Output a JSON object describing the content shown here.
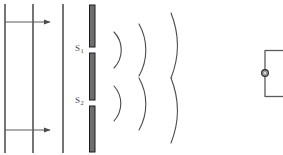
{
  "figure": {
    "background_color": "#ffffff",
    "width": 283,
    "height": 155
  },
  "colors": {
    "wavefront_line": "#3a3a3a",
    "arrow": "#555555",
    "barrier_fill": "#6e6e6e",
    "barrier_stroke": "#1a1a1a",
    "arc": "#4a4a4a",
    "detector": "#555555",
    "node_fill": "#8c8c8c",
    "label_text": "#4a4a4a"
  },
  "plane_waves": {
    "name": "incident-plane-wavefronts",
    "count": 3,
    "x_positions": [
      5,
      33,
      63
    ],
    "y_top": 4,
    "y_bottom": 153,
    "stroke_width": 1.4
  },
  "direction_arrows": {
    "name": "propagation-direction-arrows",
    "count": 2,
    "items": [
      {
        "label": "upper-propagation-arrow",
        "x_start": 5,
        "x_end": 52,
        "y": 22
      },
      {
        "label": "lower-propagation-arrow",
        "x_start": 5,
        "x_end": 52,
        "y": 130
      }
    ]
  },
  "barrier": {
    "name": "double-slit-barrier",
    "x": 92,
    "thickness": 6,
    "segments": [
      {
        "label": "barrier-segment-top",
        "y_top": 5,
        "y_bottom": 47
      },
      {
        "label": "barrier-segment-middle",
        "y_top": 53,
        "y_bottom": 100
      },
      {
        "label": "barrier-segment-bottom",
        "y_top": 106,
        "y_bottom": 152
      }
    ]
  },
  "slits": [
    {
      "id": "S1",
      "label_text": "S",
      "label_subscript": "1",
      "y_center": 50,
      "gap_top": 47,
      "gap_bottom": 53
    },
    {
      "id": "S2",
      "label_text": "S",
      "label_subscript": "2",
      "y_center": 103,
      "gap_top": 100,
      "gap_bottom": 106
    }
  ],
  "circular_waves": {
    "name": "diffracted-circular-wavefronts",
    "arcs_per_slit": 3,
    "radii": [
      26,
      53,
      88
    ],
    "description": "Circular wavefronts spreading from each slit, radii increase outward; outermost pair meets near the central axis."
  },
  "detector": {
    "name": "detector-symbol",
    "x_vertical_line": 265,
    "y_top": 50,
    "y_bottom": 97,
    "stub_length": 18,
    "node": {
      "label": "detector-node",
      "cx": 265,
      "cy": 73,
      "r": 3.4
    }
  }
}
